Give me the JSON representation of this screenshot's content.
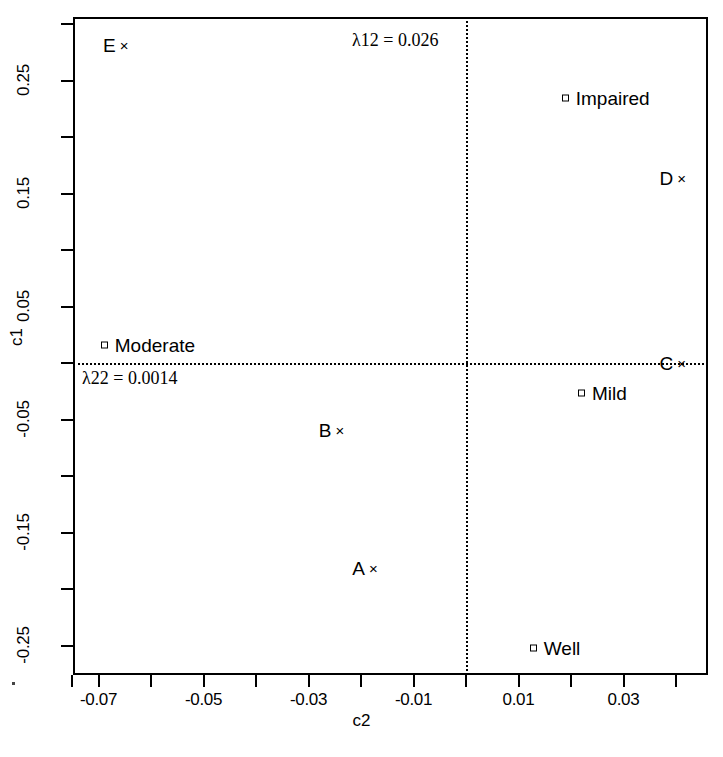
{
  "axes": {
    "xlabel": "c2",
    "ylabel": "c1",
    "x_ticklabels": [
      "-0.07",
      "-0.05",
      "-0.03",
      "-0.01",
      "0.01",
      "0.03"
    ],
    "y_ticklabels": [
      "0.25",
      "0.15",
      "0.05",
      "-0.05",
      "-0.15",
      "-0.25"
    ]
  },
  "annotations": [
    {
      "name": "lambda12",
      "text": "λ12 = 0.026"
    },
    {
      "name": "lambda22",
      "text": "λ22 = 0.0014"
    }
  ],
  "points": {
    "E": "E",
    "D": "D",
    "C": "C",
    "B": "B",
    "A": "A",
    "Impaired": "Impaired",
    "Moderate": "Moderate",
    "Mild": "Mild",
    "Well": "Well",
    "x_marker": "×"
  },
  "chart_data": {
    "type": "scatter",
    "title": "",
    "xlabel": "c2",
    "ylabel": "c1",
    "xlim": [
      -0.0748,
      0.0461
    ],
    "ylim": [
      -0.3065,
      0.3063
    ],
    "xticks": [
      -0.07,
      -0.05,
      -0.03,
      -0.01,
      0.01,
      0.03
    ],
    "yticks": [
      0.25,
      0.15,
      0.05,
      -0.05,
      -0.15,
      -0.25
    ],
    "minor_ticks": true,
    "grid": false,
    "legend": null,
    "reference_lines": [
      {
        "orientation": "horizontal",
        "value": 0,
        "style": "dotted"
      },
      {
        "orientation": "vertical",
        "value": 0,
        "style": "dotted"
      }
    ],
    "annotations": [
      {
        "text": "λ12 = 0.026",
        "x": -0.0105,
        "y": 0.2853
      },
      {
        "text": "λ22 = 0.0014",
        "x": -0.069,
        "y": -0.0168
      }
    ],
    "series": [
      {
        "name": "row profiles",
        "marker": "x",
        "points": [
          {
            "label": "E",
            "x": -0.0643,
            "y": 0.2818
          },
          {
            "label": "D",
            "x": 0.0419,
            "y": 0.1637
          },
          {
            "label": "C",
            "x": 0.0419,
            "y": 0.0
          },
          {
            "label": "B",
            "x": -0.0232,
            "y": -0.0593
          },
          {
            "label": "A",
            "x": -0.0168,
            "y": -0.1814
          }
        ]
      },
      {
        "name": "column profiles",
        "marker": "square",
        "points": [
          {
            "label": "Impaired",
            "x": 0.019,
            "y": 0.2345
          },
          {
            "label": "Moderate",
            "x": -0.0688,
            "y": 0.0159
          },
          {
            "label": "Mild",
            "x": 0.0221,
            "y": -0.0265
          },
          {
            "label": "Well",
            "x": 0.0129,
            "y": -0.2522
          }
        ]
      }
    ]
  },
  "layout": {
    "plot_left": 73,
    "plot_top": 17,
    "plot_width": 635,
    "plot_height": 658,
    "x0_px": 466,
    "y0_px": 363,
    "px_per_x": 5250,
    "px_per_y": 1130
  }
}
